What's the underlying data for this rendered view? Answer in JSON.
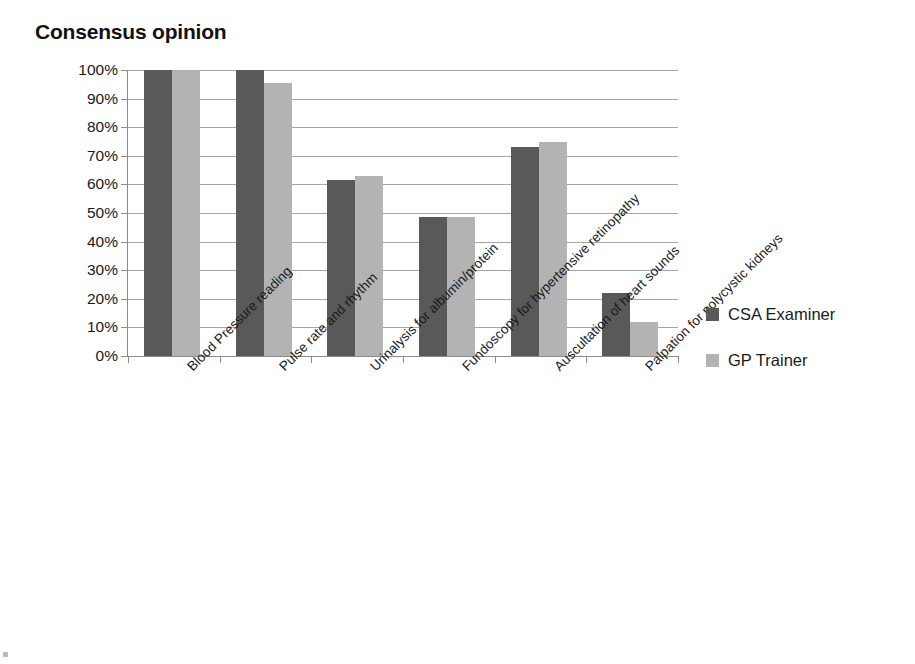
{
  "chart_data": {
    "type": "bar",
    "title": "Consensus opinion",
    "xlabel": "",
    "ylabel": "",
    "ylim": [
      0,
      100
    ],
    "ytick_labels": [
      "100%",
      "90%",
      "80%",
      "70%",
      "60%",
      "50%",
      "40%",
      "30%",
      "20%",
      "10%",
      "0%"
    ],
    "ytick_values": [
      100,
      90,
      80,
      70,
      60,
      50,
      40,
      30,
      20,
      10,
      0
    ],
    "grid": true,
    "legend_position": "right",
    "categories": [
      "Blood Pressure reading",
      "Pulse rate and rhythm",
      "Urinalysis for albumin/protein",
      "Fundoscopy for hypertensive retinopathy",
      "Auscultation of heart sounds",
      "Palpation for polycystic kidneys"
    ],
    "series": [
      {
        "name": "CSA Examiner",
        "color": "#595959",
        "values": [
          100,
          100,
          61.5,
          48.5,
          73,
          22
        ]
      },
      {
        "name": "GP Trainer",
        "color": "#b3b3b3",
        "values": [
          100,
          95.5,
          63,
          48.5,
          75,
          12
        ]
      }
    ]
  },
  "legend": {
    "items": [
      {
        "label": "CSA Examiner"
      },
      {
        "label": "GP Trainer"
      }
    ]
  }
}
